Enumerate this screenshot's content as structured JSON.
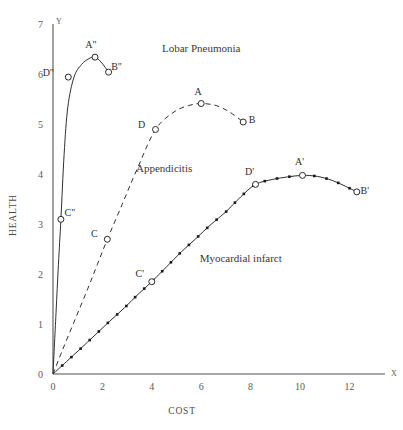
{
  "chart_data": {
    "type": "line",
    "title": "",
    "xlabel": "COST",
    "ylabel": "HEALTH",
    "xlim": [
      0,
      13
    ],
    "ylim": [
      0,
      7
    ],
    "grid": false,
    "legend_position": "inline-annotations",
    "x_ticks": [
      "0",
      "2",
      "4",
      "6",
      "8",
      "10",
      "12"
    ],
    "x_tick_values": [
      0,
      2,
      4,
      6,
      8,
      10,
      12
    ],
    "y_ticks": [
      "0",
      "1",
      "2",
      "3",
      "4",
      "5",
      "6",
      "7"
    ],
    "y_tick_values": [
      0,
      1,
      2,
      3,
      4,
      5,
      6,
      7
    ],
    "x_axis_cap": "X",
    "y_axis_cap": "Y",
    "series": [
      {
        "name": "Lobar Pneumonia",
        "style": "solid",
        "label_x": 6.0,
        "label_y": 6.45,
        "x": [
          0,
          0.12,
          0.22,
          0.32,
          0.45,
          0.6,
          0.85,
          1.15,
          1.45,
          1.7,
          1.95,
          2.25
        ],
        "y": [
          0,
          1.2,
          2.2,
          3.1,
          4.4,
          5.35,
          5.95,
          6.2,
          6.32,
          6.35,
          6.25,
          6.05
        ],
        "points": [
          {
            "label": "C\"",
            "x": 0.32,
            "y": 3.1,
            "label_dx": 9,
            "label_dy": -3
          },
          {
            "label": "D\"",
            "x": 0.62,
            "y": 5.95,
            "label_dx": -20,
            "label_dy": -1
          },
          {
            "label": "A\"",
            "x": 1.7,
            "y": 6.35,
            "label_dx": -4,
            "label_dy": -9
          },
          {
            "label": "B\"",
            "x": 2.25,
            "y": 6.05,
            "label_dx": 8,
            "label_dy": -2
          }
        ]
      },
      {
        "name": "Appendicitis",
        "style": "dashed",
        "label_x": 4.5,
        "label_y": 4.05,
        "x": [
          0,
          0.4,
          0.9,
          1.4,
          1.8,
          2.2,
          2.8,
          3.4,
          4.15,
          4.9,
          5.5,
          6.0,
          6.6,
          7.15,
          7.7
        ],
        "y": [
          0,
          0.5,
          1.1,
          1.7,
          2.2,
          2.7,
          3.4,
          4.1,
          4.9,
          5.25,
          5.38,
          5.42,
          5.38,
          5.25,
          5.05
        ],
        "points": [
          {
            "label": "C",
            "x": 2.2,
            "y": 2.7,
            "label_dx": -13,
            "label_dy": -2
          },
          {
            "label": "D",
            "x": 4.15,
            "y": 4.9,
            "label_dx": -14,
            "label_dy": -1
          },
          {
            "label": "A",
            "x": 6.0,
            "y": 5.42,
            "label_dx": -3,
            "label_dy": -9
          },
          {
            "label": "B",
            "x": 7.7,
            "y": 5.05,
            "label_dx": 9,
            "label_dy": 1
          }
        ]
      },
      {
        "name": "Myocardial infarct",
        "style": "dotted",
        "label_x": 7.6,
        "label_y": 2.25,
        "x": [
          0,
          0.55,
          1.1,
          1.7,
          2.3,
          2.9,
          3.45,
          4.0,
          4.6,
          5.2,
          5.8,
          6.4,
          7.0,
          7.6,
          8.2,
          8.9,
          9.5,
          10.1,
          10.7,
          11.3,
          11.85,
          12.3
        ],
        "y": [
          0,
          0.25,
          0.5,
          0.78,
          1.06,
          1.33,
          1.6,
          1.85,
          2.15,
          2.45,
          2.72,
          3.0,
          3.25,
          3.55,
          3.8,
          3.9,
          3.95,
          3.98,
          3.96,
          3.88,
          3.76,
          3.65
        ],
        "points": [
          {
            "label": "C'",
            "x": 4.0,
            "y": 1.85,
            "label_dx": -12,
            "label_dy": -5
          },
          {
            "label": "D'",
            "x": 8.2,
            "y": 3.8,
            "label_dx": -6,
            "label_dy": -9
          },
          {
            "label": "A'",
            "x": 10.1,
            "y": 3.98,
            "label_dx": -3,
            "label_dy": -10
          },
          {
            "label": "B'",
            "x": 12.3,
            "y": 3.65,
            "label_dx": 8,
            "label_dy": 2
          }
        ]
      }
    ]
  },
  "colors": {
    "axis": "#8a8a8a",
    "curve": "#303030",
    "text": "#3a3a3a",
    "background": "#ffffff"
  }
}
